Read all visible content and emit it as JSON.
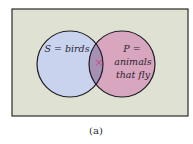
{
  "diagram": {
    "type": "venn",
    "universe": {
      "fill": "#dfe1d2",
      "stroke": "#2b2b2b"
    },
    "sets": [
      {
        "id": "S",
        "label": "S = birds",
        "fill": "#c9d3ee"
      },
      {
        "id": "P",
        "label_lines": [
          "P =",
          "animals",
          "that fly"
        ],
        "fill": "#d9a6bf"
      }
    ],
    "intersection": {
      "fill": "#a690b4",
      "marker": "×",
      "marker_color": "#c8508a"
    },
    "caption": "(a)"
  }
}
